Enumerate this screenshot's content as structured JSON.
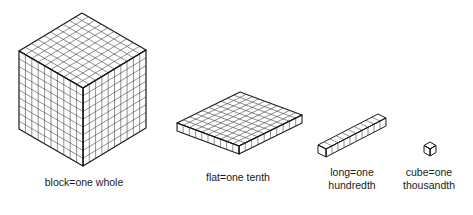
{
  "models": [
    {
      "id": "block",
      "label": "block=one whole",
      "label_lines": [
        "block=one whole"
      ],
      "grid": [
        10,
        10,
        10
      ],
      "value": 1
    },
    {
      "id": "flat",
      "label": "flat=one tenth",
      "label_lines": [
        "flat=one tenth"
      ],
      "grid": [
        10,
        10,
        1
      ],
      "value": 0.1
    },
    {
      "id": "long",
      "label": "long=one hundredth",
      "label_lines": [
        "long=one",
        "hundredth"
      ],
      "grid": [
        10,
        1,
        1
      ],
      "value": 0.01
    },
    {
      "id": "cube",
      "label": "cube=one thousandth",
      "label_lines": [
        "cube=one",
        "thousandth"
      ],
      "grid": [
        1,
        1,
        1
      ],
      "value": 0.001
    }
  ],
  "colors": {
    "line": "#1a1a1a",
    "grid": "#444444",
    "face": "#ffffff"
  }
}
